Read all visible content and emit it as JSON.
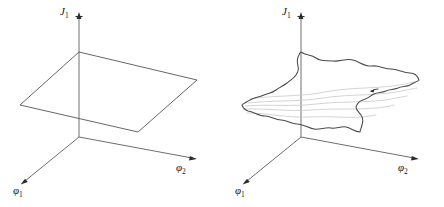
{
  "figure": {
    "kind": "two-panel-3d-axes-diagram",
    "background_color": "#ffffff",
    "axis_color": "#6e6e6e",
    "curve_color": "#4a4a4a",
    "gridline_color": "#c9c9c9",
    "label_color": "#1b1b1b"
  },
  "panels": [
    {
      "id": "left",
      "name": "flat-plane-panel",
      "surface_type": "flat-plane",
      "origin": [
        79,
        137
      ],
      "axes": [
        {
          "name": "J1",
          "label_main": "J",
          "label_sub": "1",
          "direction": "vertical-up",
          "tip": [
            79,
            13
          ],
          "label_pos": [
            62,
            11
          ]
        },
        {
          "name": "phi1",
          "label_main": "φ",
          "label_sub": "1",
          "direction": "lower-left",
          "tip": [
            21,
            184
          ],
          "label_pos": [
            14,
            186
          ]
        },
        {
          "name": "phi2",
          "label_main": "φ",
          "label_sub": "2",
          "direction": "lower-right",
          "tip": [
            196,
            159
          ],
          "label_pos": [
            177,
            163
          ]
        }
      ],
      "plane_corners": [
        [
          79,
          52
        ],
        [
          197,
          80
        ],
        [
          138,
          132
        ],
        [
          20,
          105
        ]
      ]
    },
    {
      "id": "right",
      "name": "wavy-surface-panel",
      "surface_type": "corrugated-wavy-surface",
      "origin": [
        301,
        137
      ],
      "axes": [
        {
          "name": "J1",
          "label_main": "J",
          "label_sub": "1",
          "direction": "vertical-up",
          "tip": [
            301,
            13
          ],
          "label_pos": [
            284,
            11
          ]
        },
        {
          "name": "phi1",
          "label_main": "φ",
          "label_sub": "1",
          "direction": "lower-left",
          "tip": [
            243,
            184
          ],
          "label_pos": [
            236,
            186
          ]
        },
        {
          "name": "phi2",
          "label_main": "φ",
          "label_sub": "2",
          "direction": "lower-right",
          "tip": [
            418,
            159
          ],
          "label_pos": [
            399,
            163
          ]
        }
      ],
      "surface_corners": [
        [
          301,
          52
        ],
        [
          419,
          80
        ],
        [
          360,
          132
        ],
        [
          242,
          105
        ]
      ],
      "interior_gridline_count": 5,
      "annotation_mark_pos": [
        375,
        90
      ]
    }
  ],
  "labels": {
    "j1": "J",
    "j1_sub": "1",
    "phi": "φ",
    "phi1_sub": "1",
    "phi2_sub": "2"
  }
}
